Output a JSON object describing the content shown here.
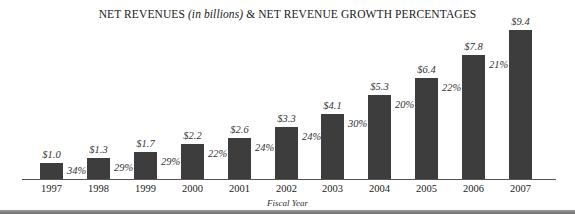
{
  "chart_data": {
    "type": "bar",
    "title": "NET REVENUES (in billions) & NET REVENUE GROWTH PERCENTAGES",
    "title_parts": {
      "pre": "NET REVENUES ",
      "italic": "(in billions)",
      "post": " & NET REVENUE GROWTH PERCENTAGES"
    },
    "xlabel": "Fiscal Year",
    "ylabel": "",
    "categories": [
      "1997",
      "1998",
      "1999",
      "2000",
      "2001",
      "2002",
      "2003",
      "2004",
      "2005",
      "2006",
      "2007"
    ],
    "series": [
      {
        "name": "Net Revenues (in billions)",
        "values": [
          1.0,
          1.3,
          1.7,
          2.2,
          2.6,
          3.3,
          4.1,
          5.3,
          6.4,
          7.8,
          9.4
        ],
        "labels": [
          "$1.0",
          "$1.3",
          "$1.7",
          "$2.2",
          "$2.6",
          "$3.3",
          "$4.1",
          "$5.3",
          "$6.4",
          "$7.8",
          "$9.4"
        ]
      },
      {
        "name": "Net Revenue Growth Percentage",
        "values": [
          34,
          29,
          29,
          22,
          24,
          24,
          30,
          20,
          22,
          21,
          null
        ],
        "labels": [
          "34%",
          "29%",
          "29%",
          "22%",
          "24%",
          "24%",
          "30%",
          "20%",
          "22%",
          "21%",
          ""
        ]
      }
    ],
    "ylim": [
      0,
      9.4
    ],
    "grid": false,
    "legend": "none",
    "colors": {
      "bar": "#3d3d3d",
      "axis": "#555555",
      "footer": "#7a7a7a"
    }
  }
}
